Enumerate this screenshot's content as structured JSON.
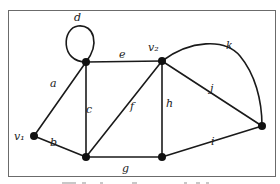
{
  "diagram": {
    "type": "graph",
    "frame": {
      "x": 8,
      "y": 10,
      "width": 268,
      "height": 166,
      "stroke": "#6b6b6b"
    },
    "colors": {
      "edge": "#1a1a1a",
      "vertex": "#111111",
      "label": "#1a1a1a"
    },
    "vertices": [
      {
        "id": "v1",
        "label": "v₁",
        "x": 34,
        "y": 136,
        "lx": 14,
        "ly": 141
      },
      {
        "id": "tl",
        "label": "",
        "x": 86,
        "y": 62
      },
      {
        "id": "v2",
        "label": "v₂",
        "x": 162,
        "y": 61,
        "lx": 149,
        "ly": 51
      },
      {
        "id": "r",
        "label": "",
        "x": 262,
        "y": 126
      },
      {
        "id": "bl",
        "label": "",
        "x": 86,
        "y": 157
      },
      {
        "id": "bm",
        "label": "",
        "x": 162,
        "y": 157
      }
    ],
    "edges": [
      {
        "label": "a",
        "from": "v1",
        "to": "tl",
        "lx": 52,
        "ly": 86
      },
      {
        "label": "b",
        "from": "v1",
        "to": "bl",
        "lx": 51,
        "ly": 152
      },
      {
        "label": "c",
        "from": "tl",
        "to": "bl",
        "lx": 88,
        "ly": 114
      },
      {
        "label": "d",
        "loop": "tl",
        "lx": 76,
        "ly": 21
      },
      {
        "label": "e",
        "from": "tl",
        "to": "v2",
        "lx": 120,
        "ly": 58
      },
      {
        "label": "f",
        "from": "bl",
        "to": "v2",
        "lx": 130,
        "ly": 111
      },
      {
        "label": "g",
        "from": "bl",
        "to": "bm",
        "lx": 122,
        "ly": 174
      },
      {
        "label": "h",
        "from": "v2",
        "to": "bm",
        "lx": 166,
        "ly": 106
      },
      {
        "label": "i",
        "from": "bm",
        "to": "r",
        "lx": 212,
        "ly": 145
      },
      {
        "label": "j",
        "from": "v2",
        "to": "r",
        "lx": 210,
        "ly": 91
      },
      {
        "label": "k",
        "curve": true,
        "from": "v2",
        "to": "r",
        "lx": 227,
        "ly": 48
      }
    ],
    "caption": "Figure caption (cut off)"
  }
}
